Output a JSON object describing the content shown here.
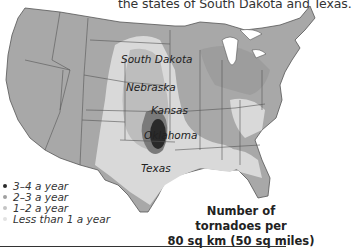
{
  "caption": "the states of South Dakota and Texas.",
  "map": {
    "region": "United States",
    "colors": {
      "land_base": "#a8a8a8",
      "band_less_than_1": "#d9d9d9",
      "band_1_2": "#bdbdbd",
      "band_2_3": "#7a7a7a",
      "band_3_4": "#2a2a2a",
      "borders": "#555555",
      "water": "#ffffff"
    },
    "state_labels": [
      {
        "name": "South Dakota"
      },
      {
        "name": "Nebraska"
      },
      {
        "name": "Kansas"
      },
      {
        "name": "Oklahoma"
      },
      {
        "name": "Texas"
      }
    ]
  },
  "legend": {
    "items": [
      {
        "label": "3–4 a year",
        "color": "#2a2a2a"
      },
      {
        "label": "2–3 a year",
        "color": "#a0a0a0"
      },
      {
        "label": "1–2 a year",
        "color": "#c4c4c4"
      },
      {
        "label": "Less than 1 a year",
        "color": "#e2e2e2"
      }
    ]
  },
  "units": {
    "line1": "Number of",
    "line2": "tornadoes per",
    "line3": "80 sq km (50 sq miles)"
  }
}
